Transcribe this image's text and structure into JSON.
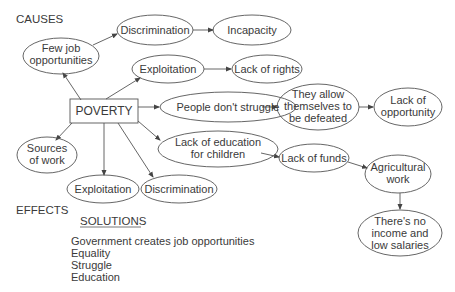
{
  "sections": {
    "causes_label": "CAUSES",
    "effects_label": "EFFECTS",
    "solutions_label": "SOLUTIONS"
  },
  "center": {
    "label": "POVERTY"
  },
  "nodes": {
    "discrimination_top": [
      "Discrimination"
    ],
    "incapacity": [
      "Incapacity"
    ],
    "few_jobs": [
      "Few job",
      "opportunities"
    ],
    "exploitation_top": [
      "Exploitation"
    ],
    "lack_of_rights": [
      "Lack of rights"
    ],
    "people_dont_struggle": [
      "People don't struggle"
    ],
    "allow_defeated": [
      "They allow",
      "themselves to",
      "be defeated"
    ],
    "lack_of_opportunity": [
      "Lack of",
      "opportunity"
    ],
    "lack_of_education": [
      "Lack of education",
      "for children"
    ],
    "lack_of_funds": [
      "Lack of funds"
    ],
    "agricultural_work": [
      "Agricultural",
      "work"
    ],
    "no_income": [
      "There's no",
      "income and",
      "low salaries"
    ],
    "sources_of_work": [
      "Sources",
      "of work"
    ],
    "exploitation_bottom": [
      "Exploitation"
    ],
    "discrimination_bottom": [
      "Discrimination"
    ]
  },
  "solutions": [
    "Government creates job opportunities",
    "Equality",
    "Struggle",
    "Education"
  ],
  "colors": {
    "stroke": "#555555",
    "text": "#3a3a3a",
    "background": "#ffffff"
  }
}
